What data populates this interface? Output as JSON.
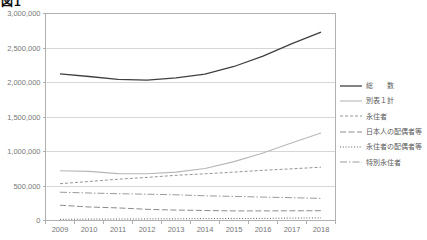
{
  "figure_label": "図1",
  "chart_data": {
    "type": "line",
    "title": "",
    "xlabel": "",
    "ylabel": "",
    "categories": [
      "2009",
      "2010",
      "2011",
      "2012",
      "2013",
      "2014",
      "2015",
      "2016",
      "2017",
      "2018"
    ],
    "ylim": [
      0,
      3000000
    ],
    "ytick_interval": 500000,
    "y_tick_labels": [
      "0",
      "500,000",
      "1,000,000",
      "1,500,000",
      "2,000,000",
      "2,500,000",
      "3,000,000"
    ],
    "grid": "horizontal",
    "legend_position": "right",
    "colors": {
      "gridline": "#d6d6d6",
      "axis": "#b0b0b0",
      "tick_label": "#767676",
      "legend_text": "#595959"
    },
    "series": [
      {
        "name": "総　　数",
        "line_style": "solid",
        "color": "#404040",
        "width": 1.3,
        "dash": "",
        "values": [
          2125000,
          2087000,
          2047000,
          2034000,
          2066000,
          2122000,
          2232000,
          2383000,
          2562000,
          2731000
        ]
      },
      {
        "name": "別表１計",
        "line_style": "solid",
        "color": "#b7b7b7",
        "width": 1.1,
        "dash": "",
        "values": [
          721000,
          712000,
          679000,
          678000,
          702000,
          754000,
          853000,
          978000,
          1128000,
          1266000
        ]
      },
      {
        "name": "永住者",
        "line_style": "short-dash",
        "color": "#969696",
        "width": 1,
        "dash": "3 2",
        "values": [
          533000,
          565000,
          598000,
          625000,
          655000,
          677000,
          701000,
          727000,
          749000,
          772000
        ]
      },
      {
        "name": "日本人の配偶者等",
        "line_style": "dashed",
        "color": "#8c8c8c",
        "width": 1,
        "dash": "6 2.5",
        "values": [
          222000,
          196000,
          182000,
          162000,
          151000,
          145000,
          139000,
          139000,
          141000,
          142000
        ]
      },
      {
        "name": "永住者の配偶者等",
        "line_style": "dotted",
        "color": "#5f5f5f",
        "width": 1,
        "dash": "1 1.8",
        "values": [
          18000,
          20000,
          22000,
          23000,
          25000,
          27000,
          29000,
          31000,
          35000,
          38000
        ]
      },
      {
        "name": "特別永住者",
        "line_style": "dash-dot",
        "color": "#9b9b9b",
        "width": 1,
        "dash": "7 2 1.5 2",
        "values": [
          410000,
          399000,
          389000,
          381000,
          373000,
          358000,
          349000,
          339000,
          330000,
          321000
        ]
      }
    ]
  }
}
